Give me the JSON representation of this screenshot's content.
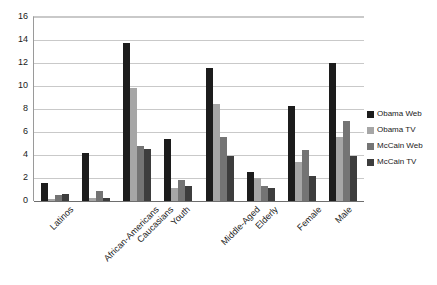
{
  "chart_data": {
    "type": "bar",
    "title": "",
    "subtitle": "",
    "xlabel": "",
    "ylabel": "",
    "ylim": [
      0,
      16
    ],
    "ytick_step": 2,
    "yticks": [
      16,
      14,
      12,
      10,
      8,
      6,
      4,
      2,
      0
    ],
    "grid": true,
    "legend_position": "right",
    "categories": [
      "Latinos",
      "African-Americans",
      "Caucasians",
      "Youth",
      "Middle-Aged",
      "Elderly",
      "Female",
      "Male"
    ],
    "series": [
      {
        "name": "Obama Web",
        "color": "#1c1c1c",
        "values": [
          1.6,
          4.2,
          13.7,
          5.4,
          11.6,
          2.5,
          8.3,
          12.0
        ]
      },
      {
        "name": "Obama TV",
        "color": "#a6a6a6",
        "values": [
          0.15,
          0.25,
          9.8,
          1.1,
          8.4,
          2.0,
          3.4,
          5.6
        ]
      },
      {
        "name": "McCain Web",
        "color": "#747474",
        "values": [
          0.55,
          0.85,
          4.8,
          1.8,
          5.6,
          1.3,
          4.4,
          7.0
        ]
      },
      {
        "name": "McCain TV",
        "color": "#3d3d3d",
        "values": [
          0.6,
          0.3,
          4.5,
          1.3,
          3.9,
          1.1,
          2.2,
          3.9
        ]
      }
    ]
  },
  "legend": {
    "items": [
      {
        "label": "Obama Web",
        "color": "#1c1c1c"
      },
      {
        "label": "Obama TV",
        "color": "#a6a6a6"
      },
      {
        "label": "McCain Web",
        "color": "#747474"
      },
      {
        "label": "McCain TV",
        "color": "#3d3d3d"
      }
    ]
  }
}
